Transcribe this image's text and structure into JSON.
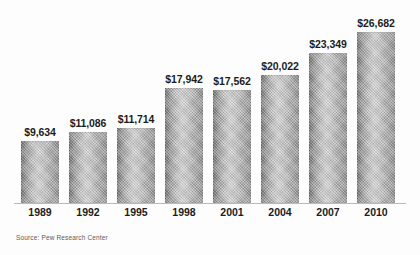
{
  "chart_data": {
    "type": "bar",
    "title": "",
    "subtitle": "",
    "xlabel": "",
    "ylabel": "",
    "grid": false,
    "legend": false,
    "axis_range": [
      0,
      28000
    ],
    "source": "Source: Pew Research Center",
    "categories": [
      "1989",
      "1992",
      "1995",
      "1998",
      "2001",
      "2004",
      "2007",
      "2010"
    ],
    "values": [
      9634,
      11086,
      11714,
      17942,
      17562,
      20022,
      23349,
      26682
    ],
    "value_labels": [
      "$9,634",
      "$11,086",
      "$11,714",
      "$17,942",
      "$17,562",
      "$20,022",
      "$23,349",
      "$26,682"
    ],
    "bars": [
      {
        "category": "1989",
        "value": 9634,
        "label": "$9,634"
      },
      {
        "category": "1992",
        "value": 11086,
        "label": "$11,086"
      },
      {
        "category": "1995",
        "value": 11714,
        "label": "$11,714"
      },
      {
        "category": "1998",
        "value": 17942,
        "label": "$17,942"
      },
      {
        "category": "2001",
        "value": 17562,
        "label": "$17,562"
      },
      {
        "category": "2004",
        "value": 20022,
        "label": "$20,022"
      },
      {
        "category": "2007",
        "value": 23349,
        "label": "$23,349"
      },
      {
        "category": "2010",
        "value": 26682,
        "label": "$26,682"
      }
    ],
    "colors": {
      "bar_dark": "#6e6e6e",
      "bar_light": "#cfcfcf",
      "bar_mid": "#9d9d9d",
      "axis": "#b9b9b9",
      "label_text": "#1c1c1c",
      "source_text": "#5a5a5a",
      "background": "#fdfdfd"
    },
    "layout": {
      "plot_left": 21,
      "plot_baseline_y": 203,
      "bar_width": 38,
      "bar_pitch": 48,
      "max_bar_height": 171
    }
  }
}
